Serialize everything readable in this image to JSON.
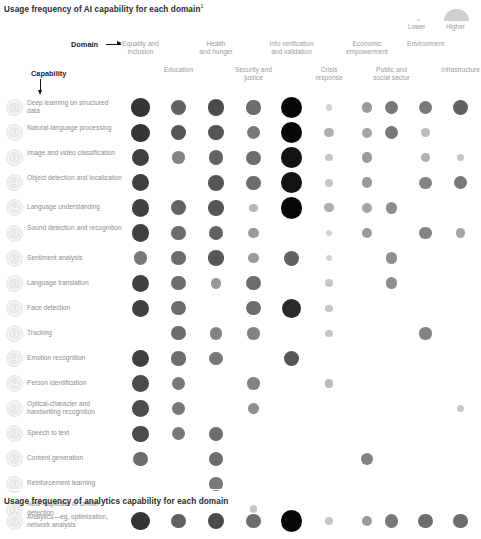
{
  "titles": {
    "main": "Usage frequency of AI capability for each domain",
    "main_footnote": "1",
    "sub": "Usage frequency of analytics capability for each domain"
  },
  "legend": {
    "lower_label": "Lower",
    "higher_label": "Higher",
    "low_color": "#d3d3d3",
    "high_color": "#cfcfcf"
  },
  "axes": {
    "domain_label": "Domain",
    "capability_label": "Capability"
  },
  "chart_data": {
    "type": "heatmap",
    "title": "Usage frequency of AI capability for each domain",
    "xlabel": "Domain",
    "ylabel": "Capability",
    "grid": false,
    "legend_position": "top-right",
    "encoding": "bubble size and darkness encode usage frequency (0 = none, 10 = highest)",
    "value_range": [
      0,
      10
    ],
    "categories": [
      "Equality and inclusion",
      "Education",
      "Health and hunger",
      "Security and justice",
      "Info verification and validation",
      "Crisis response",
      "Economic empowerment",
      "Public and social sector",
      "Environment",
      "Infrastructure"
    ],
    "column_headers_top": [
      "Equality and\ninclusion",
      "Health\nand hunger",
      "Info verification\nand validation",
      "Economic\nempowerment",
      "Environment"
    ],
    "column_headers_bottom": [
      "Education",
      "Security and\njustice",
      "Crisis\nresponse",
      "Public and\nsocial sector",
      "Infrastructure"
    ],
    "rows": [
      {
        "label": "Deep learning on structured data",
        "icon": "deep-learning-icon",
        "values": [
          8.0,
          6.0,
          7.0,
          5.5,
          10.0,
          1.0,
          3.5,
          5.0,
          5.0,
          6.0
        ]
      },
      {
        "label": "Natural-language processing",
        "icon": "nlp-icon",
        "values": [
          8.0,
          6.5,
          6.5,
          5.0,
          10.0,
          2.5,
          3.0,
          5.0,
          2.0,
          0
        ]
      },
      {
        "label": "Image and video classification",
        "icon": "image-video-icon",
        "values": [
          7.5,
          4.5,
          6.0,
          5.5,
          9.5,
          1.5,
          3.5,
          0,
          2.5,
          1.5
        ]
      },
      {
        "label": "Object detection and localization",
        "icon": "object-detection-icon",
        "values": [
          7.5,
          0,
          6.5,
          5.5,
          9.5,
          1.5,
          3.5,
          0,
          4.5,
          5.0
        ]
      },
      {
        "label": "Language understanding",
        "icon": "language-understanding-icon",
        "values": [
          7.5,
          6.0,
          6.5,
          2.0,
          10.0,
          2.5,
          3.0,
          4.0,
          0,
          0
        ]
      },
      {
        "label": "Sound detection and recognition",
        "icon": "sound-detection-icon",
        "values": [
          7.5,
          5.5,
          6.0,
          3.5,
          0,
          1.0,
          3.5,
          0,
          4.5,
          3.0
        ]
      },
      {
        "label": "Sentiment analysis",
        "icon": "sentiment-icon",
        "values": [
          5.0,
          5.5,
          6.5,
          3.5,
          6.0,
          1.0,
          0,
          4.0,
          0,
          0
        ]
      },
      {
        "label": "Language translation",
        "icon": "translation-icon",
        "values": [
          7.5,
          5.5,
          3.5,
          5.5,
          0,
          1.5,
          0,
          4.0,
          0,
          0
        ]
      },
      {
        "label": "Face detection",
        "icon": "face-detection-icon",
        "values": [
          7.5,
          5.5,
          0,
          5.5,
          8.5,
          1.5,
          0,
          0,
          0,
          0
        ]
      },
      {
        "label": "Tracking",
        "icon": "tracking-icon",
        "values": [
          0,
          5.5,
          4.5,
          4.5,
          0,
          1.5,
          0,
          0,
          4.5,
          0
        ]
      },
      {
        "label": "Emotion recognition",
        "icon": "emotion-icon",
        "values": [
          7.5,
          5.5,
          5.0,
          0,
          6.5,
          0,
          0,
          0,
          0,
          0
        ]
      },
      {
        "label": "Person identification",
        "icon": "person-id-icon",
        "values": [
          7.0,
          5.0,
          0,
          4.5,
          0,
          2.0,
          0,
          0,
          0,
          0
        ]
      },
      {
        "label": "Optical-character and handwriting recognition",
        "icon": "ocr-icon",
        "values": [
          7.0,
          5.0,
          0,
          4.0,
          0,
          0,
          0,
          0,
          0,
          1.5
        ]
      },
      {
        "label": "Speech to text",
        "icon": "speech-to-text-icon",
        "values": [
          7.0,
          5.0,
          5.5,
          0,
          0,
          0,
          0,
          0,
          0,
          0
        ]
      },
      {
        "label": "Content generation",
        "icon": "content-generation-icon",
        "values": [
          5.5,
          0,
          5.5,
          0,
          0,
          0,
          4.5,
          0,
          0,
          0
        ]
      },
      {
        "label": "Reinforcement learning",
        "icon": "reinforcement-learning-icon",
        "values": [
          0,
          0,
          5.0,
          0,
          0,
          0,
          0,
          0,
          0,
          0
        ]
      },
      {
        "label": "Near-duplicate or similar detection",
        "icon": "near-duplicate-icon",
        "values": [
          0,
          0,
          0,
          1.5,
          0,
          0,
          0,
          0,
          0,
          0
        ]
      }
    ],
    "analytics_row": {
      "label": "Analytics—eg, optimization, network analysis",
      "icon": "analytics-icon",
      "values": [
        8.0,
        6.0,
        7.0,
        5.5,
        10.0,
        1.5,
        3.5,
        5.0,
        5.5,
        5.5
      ]
    }
  }
}
